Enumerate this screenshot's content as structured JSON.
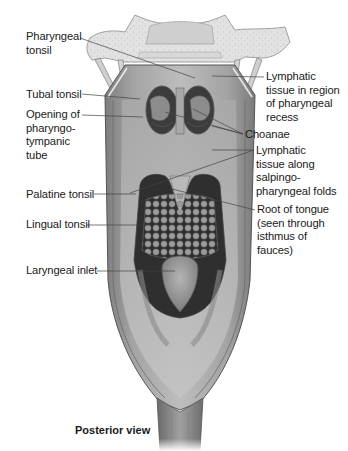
{
  "figure": {
    "view": "Posterior view",
    "colors": {
      "background": "#ffffff",
      "bone": "#d9d9d9",
      "mucosa": "#8f8f8f",
      "mucosa_light": "#b4b4b4",
      "cavity_dark": "#3a3a3a",
      "leader_line": "#444444",
      "text": "#1a1a1a"
    }
  },
  "labels_left": [
    {
      "id": "pharyngeal-tonsil",
      "text": "Pharyngeal\ntonsil"
    },
    {
      "id": "tubal-tonsil",
      "text": "Tubal tonsil"
    },
    {
      "id": "opening-pharyngotympanic-tube",
      "text": "Opening of\npharyngo-\ntympanic\ntube"
    },
    {
      "id": "palatine-tonsil",
      "text": "Palatine tonsil"
    },
    {
      "id": "lingual-tonsil",
      "text": "Lingual tonsil"
    },
    {
      "id": "laryngeal-inlet",
      "text": "Laryngeal inlet"
    }
  ],
  "labels_right": [
    {
      "id": "lymphatic-pharyngeal-recess",
      "text": "Lymphatic\ntissue in region\nof pharyngeal\nrecess"
    },
    {
      "id": "choanae",
      "text": "Choanae"
    },
    {
      "id": "lymphatic-salpingopharyngeal",
      "text": "Lymphatic\ntissue along\nsalpingo-\npharyngeal folds"
    },
    {
      "id": "root-of-tongue",
      "text": "Root of tongue\n(seen through\nisthmus of\nfauces)"
    }
  ]
}
